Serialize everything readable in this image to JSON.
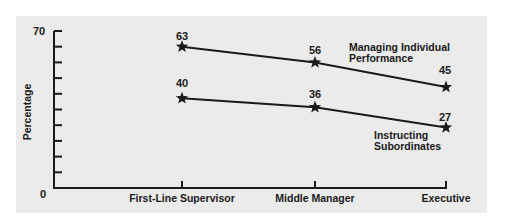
{
  "chart_data": {
    "type": "line",
    "title": "",
    "xlabel": "",
    "ylabel": "Percentage",
    "ylim": [
      0,
      70
    ],
    "y_ticks_labeled": [
      "0",
      "70"
    ],
    "y_minor_tick_step": 7,
    "categories": [
      "First-Line Supervisor",
      "Middle Manager",
      "Executive"
    ],
    "series": [
      {
        "name": "Managing Individual Performance",
        "values": [
          63,
          56,
          45
        ],
        "marker": "star",
        "color": "#1a1a1a"
      },
      {
        "name": "Instructing Subordinates",
        "values": [
          40,
          36,
          27
        ],
        "marker": "star",
        "color": "#1a1a1a"
      }
    ],
    "annotations": [
      {
        "series": "Managing Individual Performance",
        "lines": [
          "Managing Individual",
          "Performance"
        ]
      },
      {
        "series": "Instructing Subordinates",
        "lines": [
          "Instructing",
          "Subordinates"
        ]
      }
    ],
    "grid": false,
    "legend": "inline labels",
    "background": "#ebebeb"
  },
  "labels": {
    "ylabel": "Percentage",
    "ymax": "70",
    "ymin": "0",
    "cat0": "First-Line Supervisor",
    "cat1": "Middle Manager",
    "cat2": "Executive",
    "s0_line1": "Managing Individual",
    "s0_line2": "Performance",
    "s1_line1": "Instructing",
    "s1_line2": "Subordinates",
    "s0_v0": "63",
    "s0_v1": "56",
    "s0_v2": "45",
    "s1_v0": "40",
    "s1_v1": "36",
    "s1_v2": "27"
  }
}
